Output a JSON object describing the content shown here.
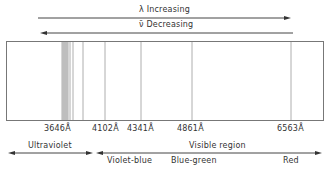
{
  "arrows": {
    "lambda": {
      "label": "λ Increasing",
      "direction": "right"
    },
    "nu": {
      "label": "ν̄ Decreasing",
      "direction": "left"
    }
  },
  "spectrum": {
    "lines": [
      {
        "wavelength": "3646Å",
        "label": "3646Å",
        "x": 66
      },
      {
        "wavelength": "4102Å",
        "label": "4102Å",
        "x": 83
      },
      {
        "wavelength": "4341Å",
        "label": "4341Å",
        "x": 105
      },
      {
        "wavelength": "4861Å",
        "label": "4861Å",
        "x": 141
      },
      {
        "wavelength": "6563Å",
        "label": "6563Å",
        "x": 291
      }
    ],
    "extra_lines_x": [
      62,
      63,
      64,
      65,
      67,
      68,
      70,
      73,
      192
    ]
  },
  "regions": {
    "ultraviolet": "Ultraviolet",
    "visible": "Visible region",
    "sub": {
      "violet_blue": "Violet-blue",
      "blue_green": "Blue-green",
      "red": "Red"
    }
  }
}
